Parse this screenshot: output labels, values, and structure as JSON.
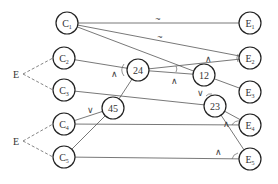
{
  "diagram": {
    "left_nodes": [
      {
        "id": "C1",
        "label": "C",
        "sub": "1",
        "x": 67,
        "y": 23
      },
      {
        "id": "C2",
        "label": "C",
        "sub": "2",
        "x": 64,
        "y": 58
      },
      {
        "id": "C3",
        "label": "C",
        "sub": "3",
        "x": 64,
        "y": 90
      },
      {
        "id": "C4",
        "label": "C",
        "sub": "4",
        "x": 64,
        "y": 124
      },
      {
        "id": "C5",
        "label": "C",
        "sub": "5",
        "x": 64,
        "y": 157
      }
    ],
    "right_nodes": [
      {
        "id": "E1",
        "label": "E",
        "sub": "1",
        "x": 250,
        "y": 23
      },
      {
        "id": "E2",
        "label": "E",
        "sub": "2",
        "x": 250,
        "y": 58
      },
      {
        "id": "E3",
        "label": "E",
        "sub": "3",
        "x": 250,
        "y": 92
      },
      {
        "id": "E4",
        "label": "E",
        "sub": "4",
        "x": 250,
        "y": 125
      },
      {
        "id": "E5",
        "label": "E",
        "sub": "5",
        "x": 250,
        "y": 159
      }
    ],
    "inner_nodes": [
      {
        "id": "n24",
        "label": "24",
        "x": 138,
        "y": 70
      },
      {
        "id": "n12",
        "label": "12",
        "x": 204,
        "y": 75
      },
      {
        "id": "n23",
        "label": "23",
        "x": 215,
        "y": 106
      },
      {
        "id": "n45",
        "label": "45",
        "x": 113,
        "y": 108
      }
    ],
    "group_labels": [
      {
        "id": "E_top",
        "label": "E",
        "x": 17,
        "y": 74,
        "targets": [
          "C2",
          "C3"
        ]
      },
      {
        "id": "E_bottom",
        "label": "E",
        "x": 17,
        "y": 141,
        "targets": [
          "C4",
          "C5"
        ]
      }
    ],
    "edges": [
      {
        "from": "C1",
        "to": "E1"
      },
      {
        "from": "C1",
        "to": "E2"
      },
      {
        "from": "C1",
        "to": "n12"
      },
      {
        "from": "C2",
        "to": "n24"
      },
      {
        "from": "C3",
        "to": "n23"
      },
      {
        "from": "C4",
        "to": "n45"
      },
      {
        "from": "C4",
        "to": "E4"
      },
      {
        "from": "C5",
        "to": "n45"
      },
      {
        "from": "C5",
        "to": "E5"
      },
      {
        "from": "n24",
        "to": "E2"
      },
      {
        "from": "n24",
        "to": "n12"
      },
      {
        "from": "n24",
        "to": "n45"
      },
      {
        "from": "n12",
        "to": "E3"
      },
      {
        "from": "n23",
        "to": "E4"
      },
      {
        "from": "n23",
        "to": "E5"
      }
    ],
    "symbols": [
      {
        "text": "~",
        "x": 158,
        "y": 22
      },
      {
        "text": "~",
        "x": 160,
        "y": 40
      },
      {
        "text": "∧",
        "x": 208,
        "y": 62
      },
      {
        "text": "∧",
        "x": 174,
        "y": 84
      },
      {
        "text": "∧",
        "x": 114,
        "y": 77
      },
      {
        "text": "∨",
        "x": 200,
        "y": 96
      },
      {
        "text": "∨",
        "x": 90,
        "y": 113
      },
      {
        "text": "∧",
        "x": 226,
        "y": 127
      },
      {
        "text": "∧",
        "x": 218,
        "y": 155
      }
    ]
  }
}
